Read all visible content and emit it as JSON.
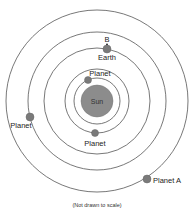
{
  "diagram": {
    "center": {
      "x": 97,
      "y": 101
    },
    "sun": {
      "label": "Sun",
      "radius": 16,
      "color": "#8c8c8c"
    },
    "orbits": [
      {
        "name": "orbit-1",
        "radius": 23
      },
      {
        "name": "orbit-2",
        "radius": 32
      },
      {
        "name": "orbit-3",
        "radius": 53
      },
      {
        "name": "orbit-4",
        "radius": 69
      },
      {
        "name": "orbit-5",
        "radius": 91
      }
    ],
    "bodies": [
      {
        "name": "inner-planet",
        "label": "Planet",
        "x": 88,
        "y": 80,
        "r": 3.5,
        "orbit": 1
      },
      {
        "name": "second-planet",
        "label": "Planet",
        "x": 95,
        "y": 133,
        "r": 3.5,
        "orbit": 2
      },
      {
        "name": "earth",
        "label": "Earth",
        "x": 107,
        "y": 49,
        "r": 4,
        "orbit": 3
      },
      {
        "name": "left-planet",
        "label": "Planet",
        "x": 30,
        "y": 117,
        "r": 4,
        "orbit": 4
      },
      {
        "name": "planet-a",
        "label": "Planet A",
        "x": 147,
        "y": 179,
        "r": 4,
        "orbit": 5
      }
    ],
    "marker": {
      "label": "B",
      "x": 107,
      "y": 43
    },
    "caption": "(Not drawn to scale)"
  },
  "colors": {
    "planet": "#7a7a7a",
    "orbit": "#555555",
    "background": "#ffffff"
  }
}
